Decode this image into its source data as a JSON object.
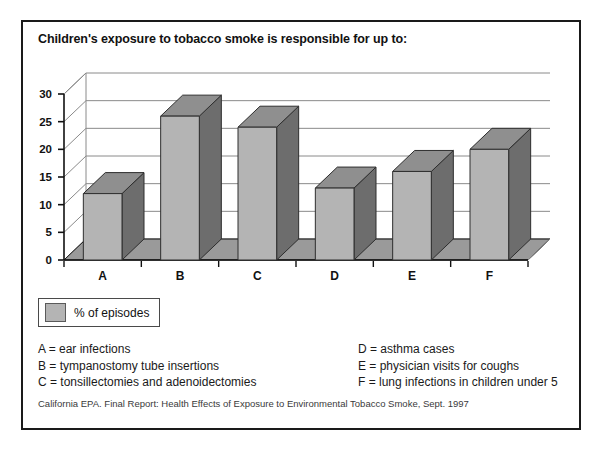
{
  "chart_data": {
    "type": "bar",
    "title": "Children's exposure to tobacco smoke is responsible for up to:",
    "categories": [
      "A",
      "B",
      "C",
      "D",
      "E",
      "F"
    ],
    "values": [
      12,
      26,
      24,
      13,
      16,
      20
    ],
    "series": [
      {
        "name": "% of episodes",
        "values": [
          12,
          26,
          24,
          13,
          16,
          20
        ]
      }
    ],
    "xlabel": "",
    "ylabel": "",
    "ylim": [
      0,
      30
    ],
    "yticks": [
      0,
      5,
      10,
      15,
      20,
      25,
      30
    ],
    "ytick_labels": [
      "0",
      "5",
      "10",
      "15",
      "20",
      "25",
      "30"
    ],
    "grid": true,
    "legend_position": "below-left",
    "legend_entries": [
      "% of episodes"
    ],
    "style": "3d-column",
    "colors": {
      "bar_front": "#b4b4b4",
      "bar_side": "#6d6d6d",
      "bar_top": "#8f8f8f",
      "floor": "#9a9a9a",
      "axis": "#111111",
      "gridline": "#8a8a8a",
      "frame": "#1a1a1a"
    },
    "annotations": [
      "A = ear infections",
      "B = tympanostomy tube insertions",
      "C = tonsillectomies and adenoidectomies",
      "D = asthma cases",
      "E = physician visits for coughs",
      "F = lung infections in children under 5"
    ]
  },
  "legend": {
    "label": "% of episodes"
  },
  "key": {
    "left": [
      "A = ear infections",
      "B = tympanostomy tube insertions",
      "C = tonsillectomies and adenoidectomies"
    ],
    "right": [
      "D = asthma cases",
      "E = physician visits for coughs",
      "F = lung infections in children under 5"
    ]
  },
  "source": {
    "text": "California EPA. Final Report: Health Effects of Exposure to Environmental Tobacco Smoke, Sept. 1997"
  }
}
